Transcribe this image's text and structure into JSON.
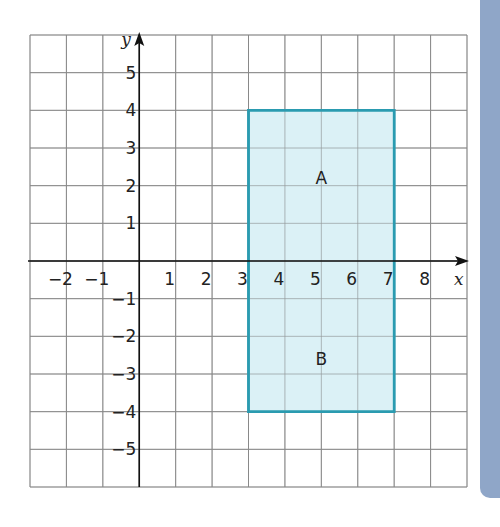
{
  "chart_data": {
    "type": "diagram",
    "title": "",
    "xlabel": "x",
    "ylabel": "y",
    "xlim": [
      -3,
      9
    ],
    "ylim": [
      -6,
      6
    ],
    "grid": true,
    "x_ticks": [
      -2,
      -1,
      1,
      2,
      3,
      4,
      5,
      6,
      7,
      8
    ],
    "y_ticks": [
      5,
      4,
      3,
      2,
      1,
      -1,
      -2,
      -3,
      -4,
      -5
    ],
    "x_tick_labels": [
      "−2",
      "−1",
      "1",
      "2",
      "3",
      "4",
      "5",
      "6",
      "7",
      "8"
    ],
    "y_tick_labels": [
      "5",
      "4",
      "3",
      "2",
      "1",
      "−1",
      "−2",
      "−3",
      "−4",
      "−5"
    ],
    "shapes": [
      {
        "type": "rectangle",
        "vertices": [
          [
            3,
            4
          ],
          [
            7,
            4
          ],
          [
            7,
            -4
          ],
          [
            3,
            -4
          ]
        ],
        "fill": "#d5eef4",
        "stroke": "#2a9bb0"
      }
    ],
    "region_labels": [
      {
        "text": "A",
        "x": 5,
        "y": 2.2
      },
      {
        "text": "B",
        "x": 5,
        "y": -2.6
      }
    ]
  },
  "colors": {
    "grid": "#8a8a8a",
    "axis": "#111111",
    "rect_fill": "#d5eef4",
    "rect_stroke": "#2a9bb0",
    "side_bar": "#8fa6c8"
  }
}
